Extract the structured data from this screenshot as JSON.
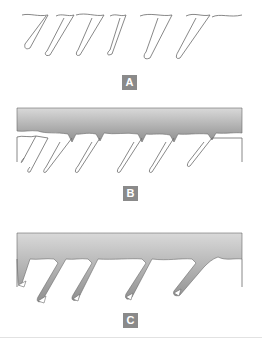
{
  "diagram": {
    "panels": [
      {
        "id": "A",
        "label": "A",
        "description": "Unfilled serrated profile outline"
      },
      {
        "id": "B",
        "label": "B",
        "description": "Gray band resting on top of serrated outline"
      },
      {
        "id": "C",
        "label": "C",
        "description": "Gray fill penetrating into serration gaps"
      }
    ]
  },
  "colors": {
    "label_bg": "#8a8a8a",
    "label_text": "#ffffff",
    "outline": "#6a6a6a",
    "fill_top": "#d9d9d9",
    "fill_bottom": "#8f8f8f"
  }
}
